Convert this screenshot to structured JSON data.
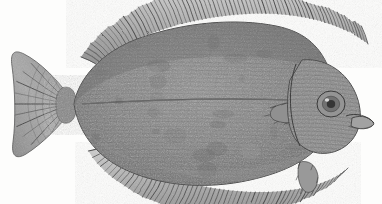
{
  "image": {
    "kind": "engraving-illustration",
    "subject": "flatfish",
    "common_name": "Flounder",
    "caption": "",
    "title": "",
    "orientation": "tail-left, head-right, eyed side up",
    "background_color": "#fdfdfc",
    "ink_color": "#3a3a3a",
    "body_mid_tone": "#808080",
    "body_dark_tone": "#5d5d5d",
    "body_light_tone": "#a9a9a9",
    "fin_tone": "#8e8e8e",
    "width_px": 382,
    "height_px": 204
  },
  "anatomy": {
    "parts": [
      {
        "id": "caudal-fin",
        "label": "Caudal fin",
        "region": "left",
        "note": "fan-shaped, radiating rays"
      },
      {
        "id": "caudal-peduncle",
        "label": "Caudal peduncle",
        "region": "left-center",
        "note": "narrow waist joining tail to body"
      },
      {
        "id": "dorsal-fin",
        "label": "Dorsal fin",
        "region": "top",
        "note": "long fringe of rays along upper margin"
      },
      {
        "id": "anal-fin",
        "label": "Anal fin",
        "region": "bottom",
        "note": "long fringe of rays along lower margin"
      },
      {
        "id": "body",
        "label": "Body",
        "region": "center",
        "note": "broad oval, stippled scale texture"
      },
      {
        "id": "lateral-line",
        "label": "Lateral line",
        "region": "center",
        "note": "horizontal line through mid-body"
      },
      {
        "id": "pectoral-fin",
        "label": "Pectoral fin",
        "region": "right-center",
        "note": "small fin behind gill cover"
      },
      {
        "id": "pelvic-fin",
        "label": "Pelvic fin",
        "region": "bottom-right",
        "note": "small fin below the belly"
      },
      {
        "id": "operculum",
        "label": "Gill cover",
        "region": "right",
        "note": "curved plate bounding the head"
      },
      {
        "id": "head",
        "label": "Head",
        "region": "right",
        "note": "blunt, eyes on this side"
      },
      {
        "id": "eye",
        "label": "Eye",
        "region": "right",
        "note": "upper eye of the migrated pair"
      },
      {
        "id": "mouth",
        "label": "Mouth",
        "region": "far-right",
        "note": "small terminal mouth"
      }
    ]
  },
  "geometry": {
    "body_outline": "M 74,104 C 78,80 100,52 140,38 C 186,22 236,18 276,26 C 306,32 322,48 330,72 C 336,92 336,118 326,136 C 314,158 286,172 250,180 C 206,190 158,186 122,168 C 94,154 78,130 74,104 Z",
    "lateral_line": "M 82,104 C 140,100 220,98 300,100",
    "caudal_outline": "M 72,100 C 58,80 40,62 24,54 C 14,49 10,53 12,66 C 15,88 16,120 13,142 C 11,156 16,160 26,154 C 42,144 60,126 72,110 Z",
    "peduncle": "M 70,88 C 78,92 80,116 70,122 C 62,126 56,120 56,104 C 56,90 62,85 70,88 Z",
    "head_plate": "M 302,60 C 324,58 344,70 354,90 C 364,110 362,132 348,144 C 332,158 308,156 296,140 C 286,126 286,100 290,80 Z",
    "eye": {
      "cx": 331,
      "cy": 104,
      "rx": 14,
      "ry": 13
    },
    "mouth": "M 352,118 C 362,114 372,118 374,124 C 370,130 358,130 351,126 Z",
    "dorsal_base": "M 96,64 C 130,36 186,18 244,14 C 296,11 340,22 368,44",
    "anal_base": "M 104,146 C 140,172 196,190 252,192 C 298,193 330,184 348,168",
    "pectoral_fin": "M 276,106 C 292,100 304,102 312,110 C 304,122 288,126 274,120 C 268,116 270,109 276,106 Z",
    "pelvic_fin": "M 300,162 C 308,160 316,164 318,176 C 318,188 312,194 306,192 C 298,188 296,170 300,162 Z"
  },
  "fins": {
    "dorsal_ray_count": 72,
    "anal_ray_count": 58,
    "caudal_ray_count": 20,
    "pectoral_ray_count": 9,
    "pelvic_ray_count": 6
  },
  "texture": {
    "stipple_seed": 1871,
    "stipple_density": 2600,
    "scale_row_spacing": 4,
    "description": "fine engraved stipple and cross-hatch giving a mottled grey skin"
  }
}
